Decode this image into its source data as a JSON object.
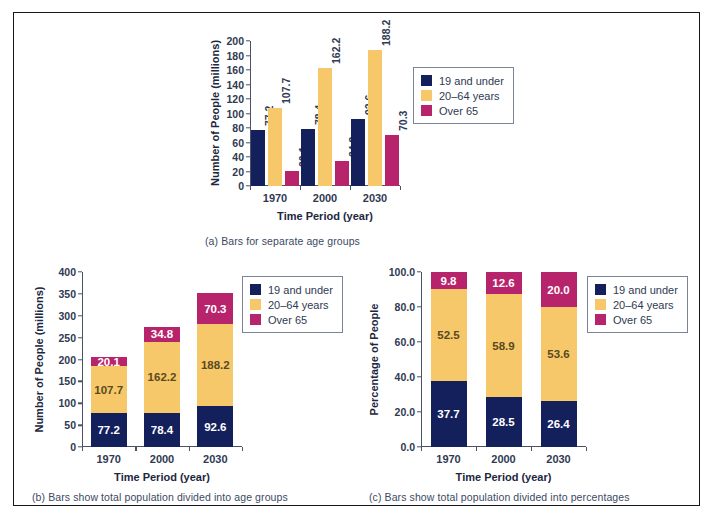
{
  "figure": {
    "border_color": "#15171c",
    "background": "#ffffff"
  },
  "palette": {
    "series_0": "#14205c",
    "series_1": "#f6c86a",
    "series_2": "#b8246b",
    "axis": "#4a5366",
    "text": "#2f3a52"
  },
  "legend": {
    "items": [
      {
        "label": "19 and under",
        "color": "#14205c"
      },
      {
        "label": "20–64 years",
        "color": "#f6c86a"
      },
      {
        "label": "Over 65",
        "color": "#b8246b"
      }
    ]
  },
  "captions": {
    "a": "(a) Bars for separate age groups",
    "b": "(b) Bars show total population divided into age groups",
    "c": "(c) Bars show total population divided into percentages"
  },
  "chart_data": [
    {
      "id": "a",
      "type": "bar",
      "title": "",
      "caption": "(a) Bars for separate age groups",
      "grouping": "grouped",
      "xlabel": "Time Period (year)",
      "ylabel": "Number of People (millions)",
      "categories": [
        "1970",
        "2000",
        "2030"
      ],
      "ylim": [
        0,
        200
      ],
      "yticks": [
        0,
        20,
        40,
        60,
        80,
        100,
        120,
        140,
        160,
        180,
        200
      ],
      "ytick_labels": [
        "0",
        "20",
        "40",
        "60",
        "80",
        "100",
        "120",
        "140",
        "160",
        "180",
        "200"
      ],
      "grid": false,
      "legend_position": "right",
      "series": [
        {
          "name": "19 and under",
          "color": "#14205c",
          "values": [
            77.2,
            78.4,
            92.6
          ]
        },
        {
          "name": "20–64 years",
          "color": "#f6c86a",
          "values": [
            107.7,
            162.2,
            188.2
          ]
        },
        {
          "name": "Over 65",
          "color": "#b8246b",
          "values": [
            20.1,
            34.8,
            70.3
          ]
        }
      ],
      "data_labels": [
        [
          "77.2",
          "107.7",
          "20.1"
        ],
        [
          "78.4",
          "162.2",
          "34.8"
        ],
        [
          "92.6",
          "188.2",
          "70.3"
        ]
      ]
    },
    {
      "id": "b",
      "type": "bar",
      "title": "",
      "caption": "(b) Bars show total population divided into age groups",
      "grouping": "stacked",
      "xlabel": "Time Period (year)",
      "ylabel": "Number of People (millions)",
      "categories": [
        "1970",
        "2000",
        "2030"
      ],
      "ylim": [
        0,
        400
      ],
      "yticks": [
        0,
        50,
        100,
        150,
        200,
        250,
        300,
        350,
        400
      ],
      "ytick_labels": [
        "0",
        "50",
        "100",
        "150",
        "200",
        "250",
        "300",
        "350",
        "400"
      ],
      "grid": false,
      "legend_position": "right",
      "series": [
        {
          "name": "19 and under",
          "color": "#14205c",
          "values": [
            77.2,
            78.4,
            92.6
          ]
        },
        {
          "name": "20–64 years",
          "color": "#f6c86a",
          "values": [
            107.7,
            162.2,
            188.2
          ]
        },
        {
          "name": "Over 65",
          "color": "#b8246b",
          "values": [
            20.1,
            34.8,
            70.3
          ]
        }
      ],
      "totals": [
        205.0,
        275.4,
        351.1
      ],
      "data_labels": [
        [
          "77.2",
          "107.7",
          "20.1"
        ],
        [
          "78.4",
          "162.2",
          "34.8"
        ],
        [
          "92.6",
          "188.2",
          "70.3"
        ]
      ]
    },
    {
      "id": "c",
      "type": "bar",
      "title": "",
      "caption": "(c) Bars show total population divided into percentages",
      "grouping": "stacked-percent",
      "xlabel": "Time Period (year)",
      "ylabel": "Percentage of People",
      "categories": [
        "1970",
        "2000",
        "2030"
      ],
      "ylim": [
        0,
        100
      ],
      "yticks": [
        0,
        20,
        40,
        60,
        80,
        100
      ],
      "ytick_labels": [
        "0.0",
        "20.0",
        "40.0",
        "60.0",
        "80.0",
        "100.0"
      ],
      "grid": false,
      "legend_position": "right",
      "series": [
        {
          "name": "19 and under",
          "color": "#14205c",
          "values": [
            37.7,
            28.5,
            26.4
          ]
        },
        {
          "name": "20–64 years",
          "color": "#f6c86a",
          "values": [
            52.5,
            58.9,
            53.6
          ]
        },
        {
          "name": "Over 65",
          "color": "#b8246b",
          "values": [
            9.8,
            12.6,
            20.0
          ]
        }
      ],
      "data_labels": [
        [
          "37.7",
          "52.5",
          "9.8"
        ],
        [
          "28.5",
          "58.9",
          "12.6"
        ],
        [
          "26.4",
          "53.6",
          "20.0"
        ]
      ]
    }
  ]
}
